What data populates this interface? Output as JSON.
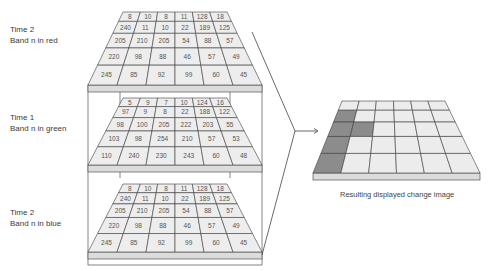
{
  "labels": {
    "top": {
      "line1": "Time 2",
      "line2": "Band n in red"
    },
    "middle": {
      "line1": "Time 1",
      "line2": "Band n in green"
    },
    "bottom": {
      "line1": "Time 2",
      "line2": "Band n in blue"
    }
  },
  "caption": "Resulting displayed change image",
  "grids": {
    "time2_red": [
      [
        8,
        10,
        8,
        11,
        128,
        18
      ],
      [
        240,
        11,
        10,
        22,
        189,
        125
      ],
      [
        205,
        210,
        205,
        54,
        88,
        57
      ],
      [
        220,
        98,
        88,
        46,
        57,
        49
      ],
      [
        245,
        85,
        92,
        99,
        60,
        45
      ]
    ],
    "time1_green": [
      [
        5,
        9,
        7,
        10,
        124,
        16
      ],
      [
        97,
        9,
        8,
        22,
        188,
        122
      ],
      [
        98,
        100,
        205,
        222,
        203,
        55
      ],
      [
        103,
        98,
        254,
        210,
        57,
        53
      ],
      [
        110,
        240,
        230,
        243,
        60,
        48
      ]
    ],
    "time2_blue": [
      [
        8,
        10,
        8,
        11,
        128,
        18
      ],
      [
        240,
        11,
        10,
        22,
        189,
        125
      ],
      [
        205,
        210,
        205,
        54,
        88,
        57
      ],
      [
        220,
        98,
        88,
        46,
        57,
        49
      ],
      [
        245,
        85,
        92,
        99,
        60,
        45
      ]
    ]
  },
  "result_grid": {
    "changed_cells": [
      [
        1,
        0
      ],
      [
        2,
        0
      ],
      [
        2,
        1
      ],
      [
        3,
        0
      ],
      [
        4,
        0
      ]
    ],
    "colors": {
      "changed": "#8c8c8c",
      "unchanged": "#ececec",
      "slab": "#d9d9d9",
      "grid_fill": "#eeeeee",
      "line": "#3c3c3c"
    }
  }
}
